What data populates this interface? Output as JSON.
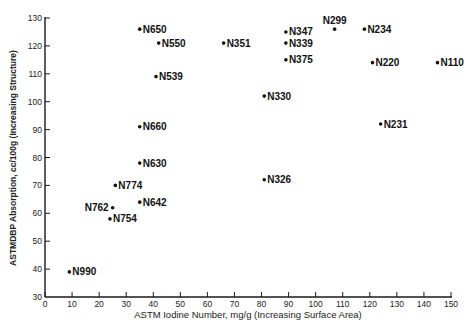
{
  "chart_data": {
    "type": "scatter",
    "title": "",
    "xlabel": "ASTM Iodine Number, mg/g (Increasing Surface Area)",
    "ylabel": "ASTMDBP Absorption, cc/100g (Increasing Structure)",
    "xlim": [
      0,
      150
    ],
    "ylim": [
      30,
      130
    ],
    "xticks": [
      0,
      10,
      20,
      30,
      40,
      50,
      60,
      70,
      80,
      90,
      100,
      110,
      120,
      130,
      140,
      150
    ],
    "yticks": [
      30,
      40,
      50,
      60,
      70,
      80,
      90,
      100,
      110,
      120,
      130
    ],
    "grid": false,
    "legend": null,
    "points": [
      {
        "label": "N650",
        "x": 35,
        "y": 126,
        "label_pos": "right"
      },
      {
        "label": "N550",
        "x": 42,
        "y": 121,
        "label_pos": "right"
      },
      {
        "label": "N539",
        "x": 41,
        "y": 109,
        "label_pos": "right"
      },
      {
        "label": "N351",
        "x": 66,
        "y": 121,
        "label_pos": "right"
      },
      {
        "label": "N347",
        "x": 89,
        "y": 125,
        "label_pos": "right"
      },
      {
        "label": "N339",
        "x": 89,
        "y": 121,
        "label_pos": "right"
      },
      {
        "label": "N375",
        "x": 89,
        "y": 115,
        "label_pos": "right"
      },
      {
        "label": "N299",
        "x": 107,
        "y": 126,
        "label_pos": "above"
      },
      {
        "label": "N234",
        "x": 118,
        "y": 126,
        "label_pos": "right"
      },
      {
        "label": "N220",
        "x": 121,
        "y": 114,
        "label_pos": "right"
      },
      {
        "label": "N110",
        "x": 145,
        "y": 114,
        "label_pos": "right"
      },
      {
        "label": "N330",
        "x": 81,
        "y": 102,
        "label_pos": "right"
      },
      {
        "label": "N660",
        "x": 35,
        "y": 91,
        "label_pos": "right"
      },
      {
        "label": "N231",
        "x": 124,
        "y": 92,
        "label_pos": "right"
      },
      {
        "label": "N630",
        "x": 35,
        "y": 78,
        "label_pos": "right"
      },
      {
        "label": "N326",
        "x": 81,
        "y": 72,
        "label_pos": "right"
      },
      {
        "label": "N774",
        "x": 26,
        "y": 70,
        "label_pos": "right"
      },
      {
        "label": "N642",
        "x": 35,
        "y": 64,
        "label_pos": "right"
      },
      {
        "label": "N762",
        "x": 25,
        "y": 62,
        "label_pos": "left"
      },
      {
        "label": "N754",
        "x": 24,
        "y": 58,
        "label_pos": "right"
      },
      {
        "label": "N990",
        "x": 9,
        "y": 39,
        "label_pos": "right"
      }
    ]
  },
  "colors": {
    "axis": "#1a1a1a",
    "point": "#111111",
    "label": "#111111"
  }
}
